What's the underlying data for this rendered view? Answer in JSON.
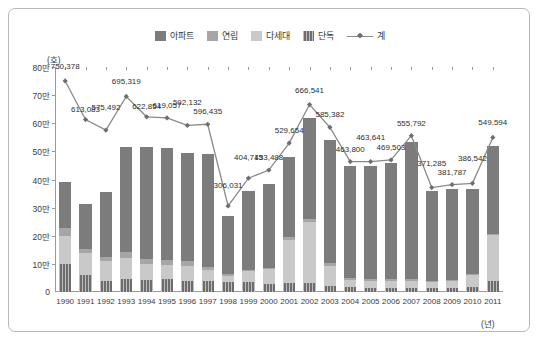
{
  "chart_data": {
    "type": "bar",
    "subtype": "stacked-bar-with-total-line",
    "title": "",
    "xlabel": "(년)",
    "ylabel": "(호)",
    "ylim": [
      0,
      800000
    ],
    "ytick_values": [
      0,
      100000,
      200000,
      300000,
      400000,
      500000,
      600000,
      700000,
      800000
    ],
    "ytick_labels": [
      "0",
      "10만",
      "20만",
      "30만",
      "40만",
      "50만",
      "60만",
      "70만",
      "80만"
    ],
    "grid": false,
    "legend_position": "top-center",
    "categories": [
      "1990",
      "1991",
      "1992",
      "1993",
      "1994",
      "1995",
      "1996",
      "1997",
      "1998",
      "1999",
      "2000",
      "2001",
      "2002",
      "2003",
      "2004",
      "2005",
      "2006",
      "2007",
      "2008",
      "2009",
      "2010",
      "2011"
    ],
    "series": [
      {
        "name": "아파트",
        "color": "#7c7c7c",
        "values": [
          163000,
          160000,
          231000,
          371000,
          400000,
          399000,
          387000,
          399000,
          208000,
          279000,
          297000,
          286000,
          362000,
          438000,
          400000,
          404000,
          412000,
          490000,
          322000,
          324000,
          303000,
          313000
        ]
      },
      {
        "name": "연립",
        "color": "#a6a6a6",
        "values": [
          27000,
          14000,
          16000,
          22000,
          18000,
          17000,
          16000,
          12000,
          7000,
          5000,
          6000,
          8000,
          10000,
          11000,
          7000,
          6000,
          5000,
          5000,
          4000,
          4000,
          4000,
          6000
        ]
      },
      {
        "name": "다세대",
        "color": "#c9c9c9",
        "values": [
          101000,
          79000,
          70000,
          75000,
          57000,
          52000,
          53000,
          40000,
          21000,
          40000,
          52000,
          155000,
          217000,
          72000,
          25000,
          23000,
          25000,
          25000,
          20000,
          25000,
          41000,
          161000
        ]
      },
      {
        "name": "단독",
        "color": "#6d6d6d",
        "values": [
          99000,
          60000,
          39000,
          47000,
          42000,
          45000,
          40000,
          38000,
          35000,
          34000,
          29000,
          31000,
          31000,
          21000,
          17000,
          16000,
          15000,
          15000,
          14000,
          15000,
          18000,
          40000
        ]
      }
    ],
    "total_line": {
      "name": "계",
      "color": "#8a8a8a",
      "marker": "diamond",
      "values": [
        750378,
        613083,
        575492,
        695319,
        622854,
        619057,
        592132,
        596435,
        306031,
        404715,
        433488,
        529654,
        666541,
        585382,
        463800,
        463641,
        469503,
        555792,
        371285,
        381787,
        386542,
        549594
      ],
      "labels": [
        "750,378",
        "613,083",
        "575,492",
        "695,319",
        "622,854",
        "619,057",
        "592,132",
        "596,435",
        "306,031",
        "404,715",
        "433,488",
        "529,654",
        "666,541",
        "585,382",
        "463,800",
        "463,641",
        "469,503",
        "555,792",
        "371,285",
        "381,787",
        "386,542",
        "549,594"
      ]
    }
  },
  "legend": {
    "items": [
      {
        "label": "아파트",
        "color": "#7c7c7c",
        "type": "swatch"
      },
      {
        "label": "연립",
        "color": "#a6a6a6",
        "type": "swatch"
      },
      {
        "label": "다세대",
        "color": "#c9c9c9",
        "type": "swatch"
      },
      {
        "label": "단독",
        "color": "#6d6d6d",
        "type": "swatch"
      },
      {
        "label": "계",
        "color": "#8a8a8a",
        "type": "line-marker"
      }
    ]
  },
  "axes": {
    "y_unit": "(호)",
    "x_unit": "(년)"
  }
}
